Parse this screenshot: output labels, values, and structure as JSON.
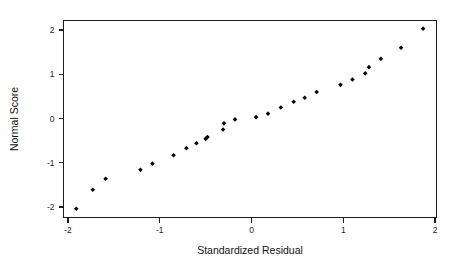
{
  "chart_data": {
    "type": "scatter",
    "title": "",
    "xlabel": "Standardized Residual",
    "ylabel": "Normal Score",
    "xlim": [
      -2.2,
      2.2
    ],
    "ylim": [
      -2.35,
      2.25
    ],
    "xticks": [
      -2,
      -1,
      0,
      1,
      2
    ],
    "xtick_labels": [
      "-2",
      "-1",
      "0",
      "1",
      "2"
    ],
    "yticks": [
      -2,
      -1,
      0,
      1,
      2
    ],
    "ytick_labels": [
      "-2",
      "-1",
      "0",
      "1",
      "2"
    ],
    "grid": false,
    "legend": false,
    "frame": "box",
    "marker": "diamond",
    "marker_color": "#050505",
    "points": [
      {
        "x": -1.91,
        "y": -2.04
      },
      {
        "x": -1.73,
        "y": -1.61
      },
      {
        "x": -1.59,
        "y": -1.36
      },
      {
        "x": -1.21,
        "y": -1.16
      },
      {
        "x": -1.08,
        "y": -1.02
      },
      {
        "x": -0.85,
        "y": -0.83
      },
      {
        "x": -0.71,
        "y": -0.67
      },
      {
        "x": -0.6,
        "y": -0.56
      },
      {
        "x": -0.5,
        "y": -0.46
      },
      {
        "x": -0.48,
        "y": -0.42
      },
      {
        "x": -0.31,
        "y": -0.25
      },
      {
        "x": -0.3,
        "y": -0.11
      },
      {
        "x": -0.18,
        "y": -0.02
      },
      {
        "x": 0.05,
        "y": 0.03
      },
      {
        "x": 0.18,
        "y": 0.11
      },
      {
        "x": 0.32,
        "y": 0.25
      },
      {
        "x": 0.46,
        "y": 0.38
      },
      {
        "x": 0.58,
        "y": 0.47
      },
      {
        "x": 0.71,
        "y": 0.6
      },
      {
        "x": 0.97,
        "y": 0.76
      },
      {
        "x": 1.1,
        "y": 0.88
      },
      {
        "x": 1.24,
        "y": 1.02
      },
      {
        "x": 1.28,
        "y": 1.16
      },
      {
        "x": 1.41,
        "y": 1.35
      },
      {
        "x": 1.63,
        "y": 1.6
      },
      {
        "x": 1.87,
        "y": 2.03
      }
    ]
  }
}
